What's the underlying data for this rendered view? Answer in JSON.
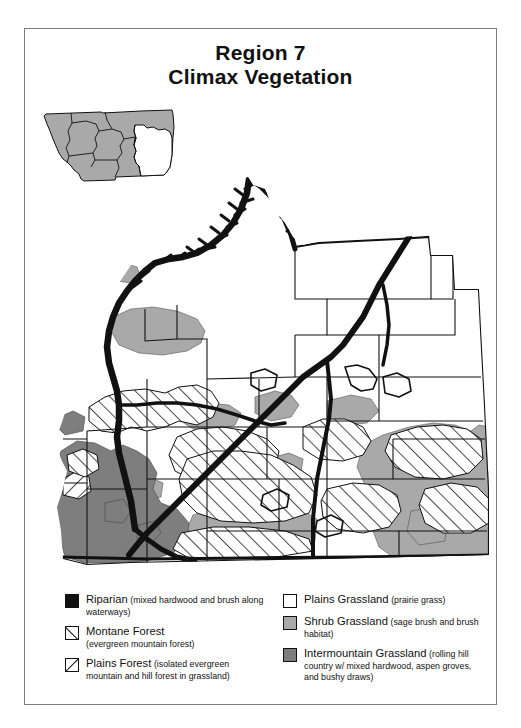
{
  "title": {
    "line1": "Region 7",
    "line2": "Climax Vegetation"
  },
  "inset": {
    "name": "montana-state-inset",
    "highlighted_region_label": "Region 7",
    "base_fill": "#a9a9a9",
    "highlight_fill": "#ffffff",
    "outline": "#111111"
  },
  "map": {
    "name": "region-7-climax-vegetation-map",
    "base_fill": "#ffffff",
    "county_line_color": "#111111",
    "riparian_color": "#111111",
    "shrub_grassland_color": "#a9a9a9",
    "intermountain_grassland_color": "#7e7e7e",
    "hatch_color": "#111111"
  },
  "legend": {
    "name": "vegetation-legend",
    "left_column": [
      {
        "key": "riparian",
        "swatch": "solid-black",
        "name": "Riparian",
        "desc": "(mixed hardwood and brush along waterways)"
      },
      {
        "key": "montane-forest",
        "swatch": "backslash-hatch",
        "name": "Montane Forest",
        "desc": "(evergreen mountain forest)"
      },
      {
        "key": "plains-forest",
        "swatch": "forwardslash-hatch",
        "name": "Plains Forest",
        "desc": "(isolated evergreen mountain and hill forest in grassland)"
      }
    ],
    "right_column": [
      {
        "key": "plains-grassland",
        "swatch": "white",
        "name": "Plains Grassland",
        "desc": "(prairie grass)"
      },
      {
        "key": "shrub-grassland",
        "swatch": "light-gray",
        "name": "Shrub Grassland",
        "desc": "(sage brush and brush habitat)"
      },
      {
        "key": "intermountain-grassland",
        "swatch": "dark-gray",
        "name": "Intermountain Grassland",
        "desc": "(rolling hill country w/ mixed hardwood, aspen groves, and bushy draws)"
      }
    ]
  },
  "colors": {
    "black": "#111111",
    "light_gray": "#a9a9a9",
    "dark_gray": "#7e7e7e",
    "white": "#ffffff",
    "frame": "#7d7d7d"
  }
}
